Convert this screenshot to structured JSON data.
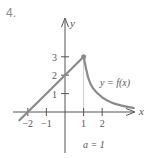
{
  "problem_number": "4.",
  "chart_data": {
    "type": "line",
    "title": "",
    "xlabel": "x",
    "ylabel": "y",
    "curve_label": "y = f(x)",
    "annotation": "a = 1",
    "x_ticks": [
      -2,
      -1,
      1,
      2
    ],
    "x_tick_labels": [
      "−2",
      "−1",
      "1",
      "2"
    ],
    "y_ticks": [
      1,
      2,
      3
    ],
    "y_tick_labels": [
      "1",
      "2",
      "3"
    ],
    "xlim": [
      -2.8,
      3.9
    ],
    "ylim": [
      -2.2,
      3.8
    ],
    "grid": false,
    "series": [
      {
        "name": "linear piece",
        "x": [
          -2.45,
          -2,
          0,
          1
        ],
        "y": [
          -0.45,
          0,
          2,
          3
        ]
      },
      {
        "name": "decaying piece",
        "x": [
          1,
          1.25,
          1.5,
          2,
          2.5,
          3,
          3.5,
          3.7
        ],
        "y": [
          3,
          1.85,
          1.3,
          0.8,
          0.52,
          0.36,
          0.25,
          0.22
        ]
      }
    ],
    "highlight_point": {
      "x": 1,
      "y": 3
    },
    "guide_line": {
      "x": 1,
      "from_y": 0,
      "to_y": 3
    }
  },
  "colors": {
    "curve": "#8a8a8a",
    "axis": "#555555",
    "guide": "#cfcfcf",
    "text": "#555555"
  }
}
